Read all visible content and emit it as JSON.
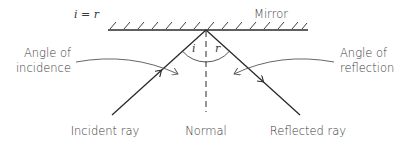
{
  "diagram": {
    "type": "law-of-reflection",
    "equation": "i = r",
    "mirror_label": "Mirror",
    "angle_incidence_label_line1": "Angle of",
    "angle_incidence_label_line2": "incidence",
    "angle_reflection_label_line1": "Angle of",
    "angle_reflection_label_line2": "reflection",
    "angle_i_symbol": "i",
    "angle_r_symbol": "r",
    "incident_ray_label": "Incident ray",
    "normal_label": "Normal",
    "reflected_ray_label": "Reflected ray"
  },
  "colors": {
    "line": "#2a2a2a",
    "pointer": "#555555",
    "text": "#3a3a3a"
  }
}
